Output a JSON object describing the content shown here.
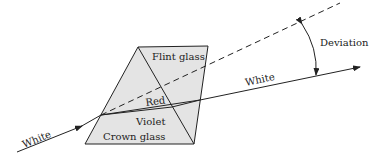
{
  "diagram": {
    "labels": {
      "flint": "Flint glass",
      "crown": "Crown glass",
      "red": "Red",
      "violet": "Violet",
      "white_in": "White",
      "white_out": "White",
      "deviation": "Deviation"
    },
    "colors": {
      "prism_fill": "#e4e4e4",
      "line": "#222222"
    }
  }
}
